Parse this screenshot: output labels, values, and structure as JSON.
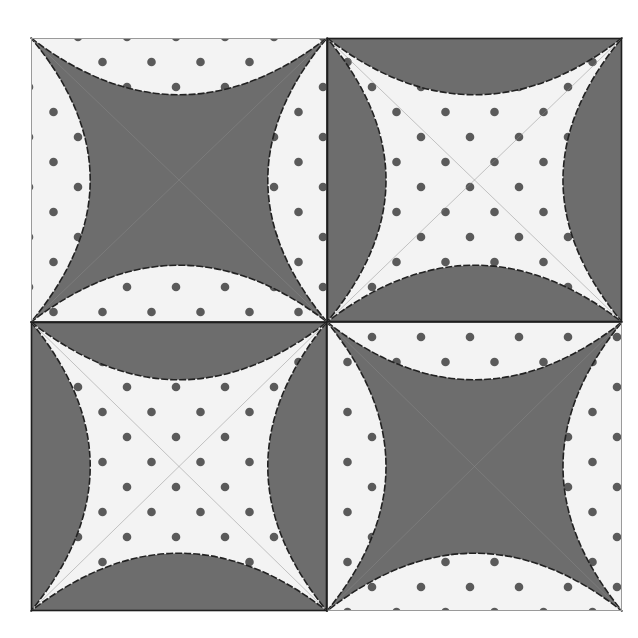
{
  "illustration": {
    "subject": "quilt block",
    "layout": "2x2",
    "outer": {
      "x0": 31,
      "y0": 38,
      "x1": 622,
      "y1": 611
    },
    "center": {
      "x": 327,
      "y": 322
    },
    "sag_ratio": 0.2,
    "colors": {
      "background": "#ffffff",
      "dark_fabric": "#6d6d6d",
      "light_fabric": "#f3f3f3",
      "dot": "#5a5a5a",
      "seam": "#222222",
      "light_border": "#9a9a9a"
    },
    "dot": {
      "radius": 4.3,
      "spacing_x": 49,
      "spacing_y": 25
    },
    "quadrants": [
      {
        "name": "top-left",
        "star": "dark",
        "background": "light-dotted"
      },
      {
        "name": "top-right",
        "star": "light-dotted",
        "background": "dark"
      },
      {
        "name": "bottom-left",
        "star": "light-dotted",
        "background": "dark"
      },
      {
        "name": "bottom-right",
        "star": "dark",
        "background": "light-dotted"
      }
    ]
  }
}
